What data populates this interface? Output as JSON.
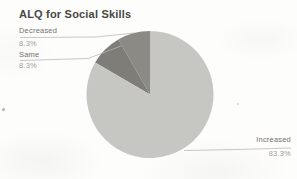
{
  "chart_data": {
    "type": "pie",
    "title": "ALQ for Social Skills",
    "legend_position": "outside-labels-with-leader-lines",
    "start_angle_deg": 0,
    "direction": "counterclockwise",
    "slices": [
      {
        "label": "Decreased",
        "percent": 8.3,
        "display_percent": "8.3%",
        "color": "#8c8a84"
      },
      {
        "label": "Same",
        "percent": 8.3,
        "display_percent": "8.3%",
        "color": "#7e7d78"
      },
      {
        "label": "Increased",
        "percent": 83.3,
        "display_percent": "83.3%",
        "color": "#c6c6c2"
      }
    ]
  },
  "colors": {
    "background": "#fdfdfc",
    "title": "#474744",
    "slice_label": "#74726c",
    "slice_value": "#a3a19b",
    "leader_line": "#b8b6b1"
  }
}
